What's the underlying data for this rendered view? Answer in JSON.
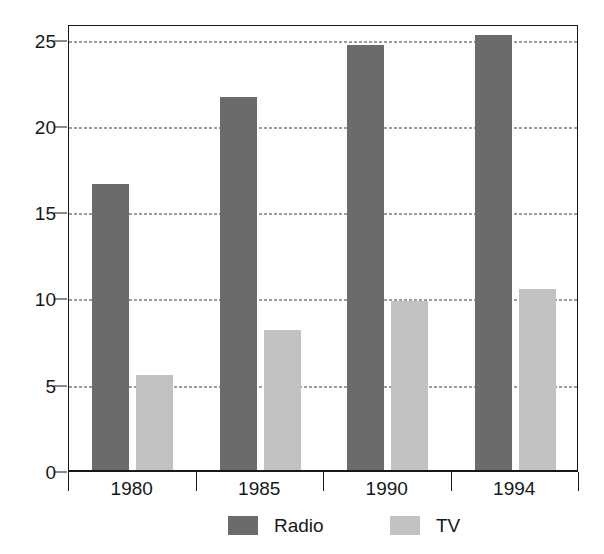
{
  "chart_data": {
    "type": "bar",
    "title": "",
    "subtitle": "",
    "xlabel": "",
    "ylabel": "",
    "categories": [
      "1980",
      "1985",
      "1990",
      "1994"
    ],
    "series": [
      {
        "name": "Radio",
        "color": "#6b6b6b",
        "values": [
          16.6,
          21.6,
          24.6,
          25.2
        ]
      },
      {
        "name": "TV",
        "color": "#c2c2c2",
        "values": [
          5.5,
          8.1,
          9.8,
          10.5
        ]
      }
    ],
    "ylim": [
      0,
      25.9
    ],
    "yticks": [
      0,
      5,
      10,
      15,
      20,
      25
    ],
    "ytick_labels": [
      "0",
      "5",
      "10",
      "15",
      "20",
      "25"
    ],
    "grid": true,
    "grid_style": "dashed-horizontal",
    "legend_position": "bottom",
    "legend": [
      {
        "label": "Radio",
        "swatch": "radio"
      },
      {
        "label": "TV",
        "swatch": "tv"
      }
    ],
    "frame_color": "#17181a",
    "background": "#ffffff"
  }
}
